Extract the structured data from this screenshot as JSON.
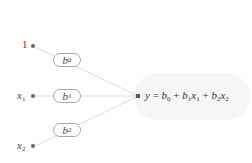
{
  "diagram": {
    "type": "linear-regression-network",
    "inputs": [
      {
        "id": "bias",
        "label": "1",
        "subscript": ""
      },
      {
        "id": "x1",
        "label": "x",
        "subscript": "1"
      },
      {
        "id": "x2",
        "label": "x",
        "subscript": "2"
      }
    ],
    "weights": [
      {
        "label": "b",
        "subscript": "0"
      },
      {
        "label": "b",
        "subscript": "1"
      },
      {
        "label": "b",
        "subscript": "2"
      }
    ],
    "output": {
      "y": "y",
      "equals": " = ",
      "b0": "b",
      "b0_sub": "0",
      "plus1": " + ",
      "b1": "b",
      "b1_sub": "1",
      "x1": "x",
      "x1_sub": "1",
      "plus2": " + ",
      "b2": "b",
      "b2_sub": "2",
      "x2": "x",
      "x2_sub": "2"
    },
    "colors": {
      "edge": "#dddddd",
      "node": "#666666",
      "pill_border": "#aaaaaa",
      "output_shade": "#f6f6f6"
    }
  }
}
